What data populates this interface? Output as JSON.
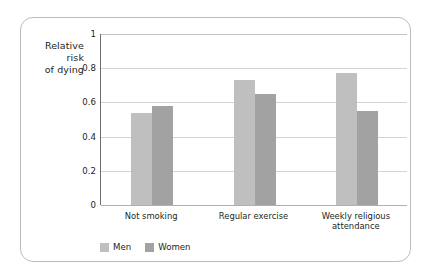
{
  "chart_data": {
    "type": "bar",
    "title": "",
    "xlabel": "",
    "ylabel": "Relative\nrisk\nof dying",
    "ylabel_lines": [
      "Relative",
      "risk",
      "of dying"
    ],
    "categories": [
      "Not smoking",
      "Regular exercise",
      "Weekly religious attendance"
    ],
    "category_lines": [
      [
        "Not smoking"
      ],
      [
        "Regular exercise"
      ],
      [
        "Weekly religious",
        "attendance"
      ]
    ],
    "series": [
      {
        "name": "Men",
        "color": "#bfbfbf",
        "values": [
          0.54,
          0.73,
          0.77
        ]
      },
      {
        "name": "Women",
        "color": "#a2a2a2",
        "values": [
          0.58,
          0.65,
          0.55
        ]
      }
    ],
    "ylim": [
      0,
      1
    ],
    "yticks": [
      0,
      0.2,
      0.4,
      0.6,
      0.8,
      1
    ],
    "ytick_labels": [
      "0",
      "0.2",
      "0.4",
      "0.6",
      "0.8",
      "1"
    ],
    "grid": true,
    "grid_axis": "y",
    "legend_position": "bottom-left"
  },
  "legend": {
    "items": [
      {
        "label": "Men",
        "color": "#bfbfbf"
      },
      {
        "label": "Women",
        "color": "#a2a2a2"
      }
    ]
  },
  "frame": {
    "border_color": "#bcbcbc"
  }
}
